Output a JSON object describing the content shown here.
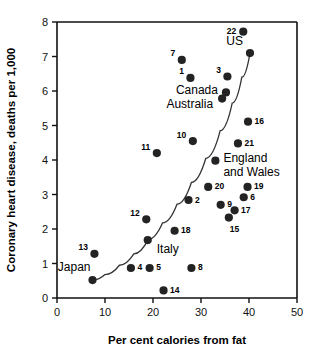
{
  "chart_data": {
    "type": "scatter",
    "title": "",
    "xlabel": "Per cent calories from fat",
    "ylabel": "Coronary heart disease, deaths per 1,000",
    "xlim": [
      0,
      50
    ],
    "ylim": [
      0,
      8
    ],
    "xticks": [
      0,
      10,
      20,
      30,
      40,
      50
    ],
    "yticks": [
      0,
      1,
      2,
      3,
      4,
      5,
      6,
      7,
      8
    ],
    "xtick_labels": [
      "0",
      "10",
      "20",
      "30",
      "40",
      "50"
    ],
    "ytick_labels": [
      "0",
      "1",
      "2",
      "3",
      "4",
      "5",
      "6",
      "7",
      "8"
    ],
    "grid": false,
    "legend": "none",
    "marker": "filled-circle",
    "marker_color": "#232323",
    "fit_curve": {
      "present": true,
      "style": "exponential trend line",
      "points": [
        [
          7.5,
          0.52
        ],
        [
          10.0,
          0.68
        ],
        [
          13.0,
          0.95
        ],
        [
          16.0,
          1.28
        ],
        [
          19.0,
          1.7
        ],
        [
          22.0,
          2.18
        ],
        [
          25.0,
          2.72
        ],
        [
          28.0,
          3.35
        ],
        [
          31.0,
          4.05
        ],
        [
          34.0,
          4.85
        ],
        [
          36.5,
          5.65
        ],
        [
          38.5,
          6.4
        ],
        [
          40.2,
          7.1
        ]
      ]
    },
    "points": [
      {
        "label": "22",
        "x": 38.8,
        "y": 7.72,
        "label_pos": "left"
      },
      {
        "label": "US",
        "x": 40.2,
        "y": 7.1,
        "label_pos": "above-left",
        "style": "name"
      },
      {
        "label": "7",
        "x": 26.0,
        "y": 6.9,
        "label_pos": "left"
      },
      {
        "label": "1",
        "x": 27.8,
        "y": 6.38,
        "label_pos": "left"
      },
      {
        "label": "3",
        "x": 35.5,
        "y": 6.42,
        "label_pos": "left"
      },
      {
        "label": "Canada",
        "x": 35.2,
        "y": 5.96,
        "label_pos": "left",
        "style": "name"
      },
      {
        "label": "Australia",
        "x": 34.4,
        "y": 5.78,
        "label_pos": "left",
        "style": "name"
      },
      {
        "label": "16",
        "x": 39.8,
        "y": 5.11,
        "label_pos": "right"
      },
      {
        "label": "10",
        "x": 28.3,
        "y": 4.55,
        "label_pos": "left"
      },
      {
        "label": "21",
        "x": 37.7,
        "y": 4.48,
        "label_pos": "right"
      },
      {
        "label": "11",
        "x": 20.8,
        "y": 4.2,
        "label_pos": "left"
      },
      {
        "label": "England and Wales",
        "x": 33.0,
        "y": 3.98,
        "label_pos": "right",
        "style": "name"
      },
      {
        "label": "20",
        "x": 31.5,
        "y": 3.22,
        "label_pos": "right"
      },
      {
        "label": "19",
        "x": 39.7,
        "y": 3.22,
        "label_pos": "right"
      },
      {
        "label": "6",
        "x": 38.9,
        "y": 2.92,
        "label_pos": "right"
      },
      {
        "label": "2",
        "x": 27.4,
        "y": 2.84,
        "label_pos": "right"
      },
      {
        "label": "9",
        "x": 34.1,
        "y": 2.7,
        "label_pos": "right"
      },
      {
        "label": "17",
        "x": 37.0,
        "y": 2.54,
        "label_pos": "right"
      },
      {
        "label": "15",
        "x": 35.8,
        "y": 2.33,
        "label_pos": "below-right"
      },
      {
        "label": "12",
        "x": 18.6,
        "y": 2.28,
        "label_pos": "left"
      },
      {
        "label": "18",
        "x": 24.5,
        "y": 1.95,
        "label_pos": "right"
      },
      {
        "label": "Italy",
        "x": 18.9,
        "y": 1.68,
        "label_pos": "below-right",
        "style": "name"
      },
      {
        "label": "13",
        "x": 7.8,
        "y": 1.28,
        "label_pos": "left"
      },
      {
        "label": "Japan",
        "x": 7.4,
        "y": 0.52,
        "label_pos": "above-left",
        "style": "name"
      },
      {
        "label": "4",
        "x": 15.4,
        "y": 0.87,
        "label_pos": "right"
      },
      {
        "label": "5",
        "x": 19.3,
        "y": 0.87,
        "label_pos": "right"
      },
      {
        "label": "8",
        "x": 28.0,
        "y": 0.87,
        "label_pos": "right"
      },
      {
        "label": "14",
        "x": 22.2,
        "y": 0.22,
        "label_pos": "right"
      }
    ]
  },
  "figure": {
    "background": "#ffffff",
    "axis_color": "#111111",
    "marker_color": "#232323",
    "curve_color": "#333333"
  }
}
